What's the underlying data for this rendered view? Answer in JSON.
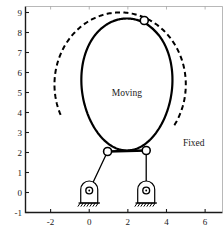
{
  "figure": {
    "title": "",
    "background_color": "#ffffff",
    "line_color": "#000000"
  },
  "annotations": {
    "moving": "Moving",
    "fixed": "Fixed"
  },
  "chart_data": {
    "type": "line",
    "title": "",
    "xlabel": "",
    "ylabel": "",
    "xlim": [
      -3.3,
      6.9
    ],
    "ylim": [
      -1,
      9.3
    ],
    "grid": false,
    "legend": "none",
    "xticks": [
      -2,
      0,
      2,
      4,
      6
    ],
    "xticklabels": [
      "-2",
      "0",
      "2",
      "4",
      "6"
    ],
    "yticks": [
      -1,
      0,
      1,
      2,
      3,
      4,
      5,
      6,
      7,
      8,
      9
    ],
    "yticklabels": [
      "-1",
      "0",
      "1",
      "2",
      "3",
      "4",
      "5",
      "6",
      "7",
      "8",
      "9"
    ],
    "series": [
      {
        "name": "Moving",
        "style": "solid",
        "description": "moving centrode, closed oval curve",
        "center": [
          1.95,
          5.35
        ],
        "rx": 2.35,
        "ry": 3.35
      },
      {
        "name": "Fixed",
        "style": "dashed",
        "description": "fixed centrode, open circular arc",
        "center": [
          1.6,
          5.4
        ],
        "radius": 3.4
      }
    ],
    "joints": [
      {
        "name": "coupler-top-joint",
        "x": 2.85,
        "y": 8.6
      },
      {
        "name": "coupler-left-joint",
        "x": 0.95,
        "y": 2.05
      },
      {
        "name": "coupler-right-joint",
        "x": 2.95,
        "y": 2.1
      }
    ],
    "ground_pivots": [
      {
        "name": "ground-pivot-left",
        "x": 0.0,
        "y": 0.1
      },
      {
        "name": "ground-pivot-right",
        "x": 2.95,
        "y": 0.1
      }
    ],
    "links": [
      {
        "name": "coupler-link",
        "from": [
          0.95,
          2.05
        ],
        "to": [
          2.95,
          2.1
        ]
      },
      {
        "name": "left-crank",
        "from": [
          0.95,
          2.05
        ],
        "to": [
          0.0,
          0.1
        ]
      },
      {
        "name": "right-crank",
        "from": [
          2.95,
          2.1
        ],
        "to": [
          2.95,
          0.1
        ]
      },
      {
        "name": "top-connector",
        "from": [
          2.85,
          8.6
        ],
        "to": [
          3.55,
          7.9
        ]
      }
    ]
  }
}
